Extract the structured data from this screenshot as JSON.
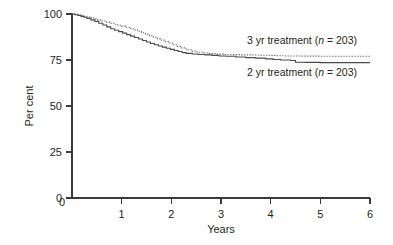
{
  "chart_data": {
    "type": "line",
    "title": "",
    "subtitle": "",
    "xlabel": "Years",
    "ylabel": "Per cent",
    "xlim": [
      0,
      6
    ],
    "ylim": [
      0,
      100
    ],
    "x_ticks": [
      "0",
      "1",
      "2",
      "3",
      "4",
      "5",
      "6"
    ],
    "x_tick_values": [
      0,
      1,
      2,
      3,
      4,
      5,
      6
    ],
    "y_ticks": [
      "0",
      "25",
      "50",
      "75",
      "100"
    ],
    "y_tick_values": [
      0,
      25,
      50,
      75,
      100
    ],
    "grid": false,
    "legend_position": "inline-right",
    "series": [
      {
        "name": "3 yr treatment (n = 203)",
        "label_prefix": "3 yr treatment (",
        "label_italic": "n",
        "label_suffix": " = 203)",
        "n": 203,
        "style": "dotted",
        "color": "#6d6d6d",
        "x": [
          0.0,
          0.06,
          0.12,
          0.18,
          0.24,
          0.3,
          0.36,
          0.44,
          0.52,
          0.6,
          0.68,
          0.76,
          0.84,
          0.92,
          1.0,
          1.08,
          1.16,
          1.24,
          1.32,
          1.4,
          1.48,
          1.56,
          1.64,
          1.72,
          1.8,
          1.88,
          1.96,
          2.04,
          2.12,
          2.2,
          2.3,
          2.4,
          2.52,
          2.64,
          2.76,
          2.9,
          3.05,
          3.2,
          3.4,
          3.6,
          3.8,
          4.0,
          4.1,
          4.3,
          4.6,
          5.0,
          5.4,
          6.0
        ],
        "y": [
          100.0,
          99.8,
          99.5,
          99.2,
          98.8,
          98.4,
          98.0,
          97.4,
          96.8,
          96.2,
          95.6,
          95.0,
          94.4,
          93.9,
          93.4,
          92.7,
          92.0,
          91.3,
          90.6,
          89.8,
          89.0,
          88.2,
          87.4,
          86.6,
          85.8,
          85.0,
          84.2,
          83.3,
          82.4,
          81.6,
          80.6,
          79.8,
          79.2,
          78.8,
          78.5,
          78.2,
          78.0,
          77.9,
          77.8,
          77.7,
          77.6,
          77.5,
          77.3,
          77.2,
          77.1,
          77.0,
          77.0,
          77.0
        ]
      },
      {
        "name": "2 yr treatment (n = 203)",
        "label_prefix": "2 yr treatment (",
        "label_italic": "n",
        "label_suffix": " = 203)",
        "n": 203,
        "style": "solid",
        "color": "#4a4a4a",
        "x": [
          0.0,
          0.06,
          0.12,
          0.18,
          0.24,
          0.3,
          0.38,
          0.46,
          0.54,
          0.62,
          0.7,
          0.78,
          0.86,
          0.94,
          1.02,
          1.1,
          1.18,
          1.26,
          1.34,
          1.42,
          1.5,
          1.58,
          1.66,
          1.74,
          1.82,
          1.9,
          1.98,
          2.06,
          2.14,
          2.22,
          2.3,
          2.42,
          2.54,
          2.68,
          2.82,
          2.96,
          3.1,
          3.3,
          3.5,
          3.7,
          3.9,
          4.05,
          4.2,
          4.4,
          4.5,
          4.7,
          5.0,
          5.4,
          6.0
        ],
        "y": [
          100.0,
          99.6,
          99.2,
          98.7,
          98.2,
          97.6,
          96.8,
          96.0,
          95.0,
          94.0,
          93.0,
          92.0,
          91.2,
          90.4,
          89.6,
          88.8,
          88.0,
          87.2,
          86.4,
          85.6,
          84.8,
          84.0,
          83.3,
          82.6,
          82.0,
          81.4,
          80.8,
          80.2,
          79.6,
          79.0,
          78.6,
          78.3,
          78.0,
          77.8,
          77.5,
          77.2,
          77.0,
          76.6,
          76.3,
          76.0,
          75.6,
          75.3,
          75.0,
          74.7,
          73.8,
          73.7,
          73.6,
          73.6,
          73.6
        ]
      }
    ]
  },
  "axes": {
    "y_label": "Per cent",
    "x_label": "Years",
    "y_tick_labels": [
      "100",
      "75",
      "50",
      "25",
      "0"
    ],
    "x_tick_labels": [
      "0",
      "1",
      "2",
      "3",
      "4",
      "5",
      "6"
    ]
  },
  "legend": {
    "items": [
      {
        "prefix": "3 yr treatment (",
        "italic": "n",
        "suffix": " = 203)",
        "style": "dotted"
      },
      {
        "prefix": "2 yr treatment (",
        "italic": "n",
        "suffix": " = 203)",
        "style": "solid"
      }
    ]
  },
  "colors": {
    "background": "#ffffff",
    "axis": "#3a3a3a",
    "text": "#231f20",
    "series_solid": "#4a4a4a",
    "series_dotted": "#6d6d6d"
  }
}
